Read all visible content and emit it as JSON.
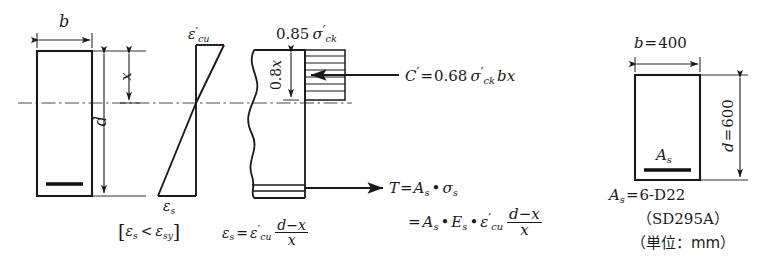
{
  "figure": {
    "unit_note": "（単位：mm）"
  },
  "colors": {
    "line": "#1a1a1a",
    "background": "#ffffff",
    "rebar": "#111111",
    "centerline": "#4a4a4a"
  },
  "section_beam": {
    "width_label": "b",
    "depth_label": "d",
    "neutral_axis_label": "x",
    "rebar_name": "tension-rebar"
  },
  "strain_diagram": {
    "top_label": "ε'cu",
    "top_label_parts": {
      "eps": "ε",
      "prime": "′",
      "sub": "cu"
    },
    "bottom_label": "εs",
    "bottom_label_parts": {
      "eps": "ε",
      "sub": "s"
    },
    "condition": "[ εs < εsy ]",
    "condition_parts": {
      "open": "[",
      "eps1": "ε",
      "sub1": "s",
      "rel": "<",
      "eps2": "ε",
      "sub2": "sy",
      "close": "]"
    },
    "strain_equation": {
      "lhs_eps": "ε",
      "lhs_sub": "s",
      "equals": "=",
      "rhs_eps": "ε",
      "rhs_prime": "′",
      "rhs_sub": "cu",
      "numerator": "d−x",
      "denominator": "x"
    }
  },
  "stress_block": {
    "stress_label": "0.85 σ'ck",
    "stress_label_parts": {
      "coef": "0.85",
      "sigma": "σ",
      "prime": "′",
      "sub": "ck"
    },
    "depth_label": "0.8x",
    "depth_label_parts": {
      "coef": "0.8",
      "x": "x"
    },
    "compression_force": {
      "symbol": "C",
      "prime": "′",
      "equals": "=",
      "coef": "0.68",
      "sigma": "σ",
      "sigma_prime": "′",
      "sigma_sub": "ck",
      "tail": "bx"
    },
    "tension_force": {
      "line1": {
        "symbol": "T",
        "equals": "=",
        "as": "A",
        "as_sub": "s",
        "dot": "•",
        "sigma": "σ",
        "sigma_sub": "s"
      },
      "line2": {
        "equals": "=",
        "as": "A",
        "as_sub": "s",
        "dot1": "•",
        "es": "E",
        "es_sub": "s",
        "dot2": "•",
        "eps": "ε",
        "eps_prime": "′",
        "eps_sub": "cu",
        "numerator": "d−x",
        "denominator": "x"
      }
    },
    "hatch_line_count": 7
  },
  "cross_section": {
    "width_label": {
      "sym": "b",
      "eq": "=",
      "val": "400"
    },
    "depth_label": {
      "sym": "d",
      "eq": "=",
      "val": "600"
    },
    "rebar_area_label": {
      "sym": "A",
      "sub": "s"
    },
    "captions": [
      {
        "sym": "A",
        "sub": "s",
        "eq": "=",
        "val": "6-D22"
      },
      {
        "text": "（SD295A）"
      },
      {
        "text": "（単位：mm）"
      }
    ]
  }
}
